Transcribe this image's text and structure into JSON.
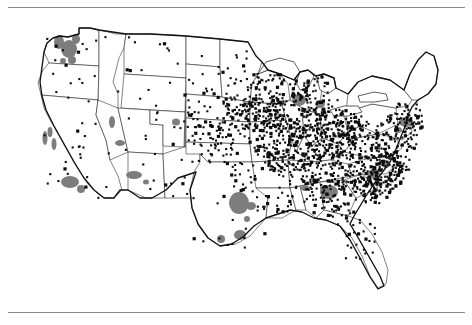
{
  "figure": {
    "kind": "dot-density-map",
    "region": "Contiguous United States",
    "rules": {
      "top": true,
      "bottom": true,
      "color": "#8a8a8a"
    }
  },
  "colors": {
    "background": "#ffffff",
    "dot": "#0d0d0d",
    "state_border": "#1a1a1a",
    "national_border": "#111111",
    "urban_shading": "#7d7d7d",
    "highlight_region": "#8e8e8e",
    "rule": "#8a8a8a"
  },
  "chart_data": {
    "type": "scatter",
    "title": "",
    "subtitle": "",
    "xlabel": "",
    "ylabel": "",
    "projection": "albers-usa-approx",
    "grid": false,
    "legend": "none",
    "xlim": [
      0,
      472
    ],
    "ylim": [
      0,
      296
    ],
    "series": [
      {
        "name": "observation-points",
        "marker": "square",
        "marker_size": 2.1,
        "color": "#0d0d0d",
        "count_visible": 1680,
        "description": "Black point markers densest in the Midwest, Ohio Valley, Mid-Atlantic and Southeast; sparse across the Great Basin, Rockies and desert Southwest."
      }
    ],
    "shaded_areas": [
      {
        "name": "highlight-nebraska-kansas",
        "color": "#8e8e8e",
        "description": "Rectangular gray block spanning Nebraska and northern Kansas"
      },
      {
        "name": "urban-puget-sound",
        "color": "#7d7d7d"
      },
      {
        "name": "urban-portland",
        "color": "#7d7d7d"
      },
      {
        "name": "urban-sf-bay",
        "color": "#7d7d7d"
      },
      {
        "name": "urban-los-angeles",
        "color": "#7d7d7d"
      },
      {
        "name": "urban-san-diego",
        "color": "#7d7d7d"
      },
      {
        "name": "urban-las-vegas",
        "color": "#7d7d7d"
      },
      {
        "name": "urban-phoenix",
        "color": "#7d7d7d"
      },
      {
        "name": "urban-tucson",
        "color": "#7d7d7d"
      },
      {
        "name": "urban-salt-lake-city",
        "color": "#7d7d7d"
      },
      {
        "name": "urban-denver",
        "color": "#7d7d7d"
      },
      {
        "name": "urban-dallas-fort-worth",
        "color": "#7d7d7d"
      },
      {
        "name": "urban-houston",
        "color": "#7d7d7d"
      },
      {
        "name": "urban-atlanta",
        "color": "#7d7d7d"
      },
      {
        "name": "urban-birmingham",
        "color": "#7d7d7d"
      },
      {
        "name": "urban-chicago",
        "color": "#7d7d7d"
      },
      {
        "name": "urban-detroit",
        "color": "#7d7d7d"
      },
      {
        "name": "urban-new-york",
        "color": "#7d7d7d"
      },
      {
        "name": "urban-charlotte",
        "color": "#7d7d7d"
      }
    ],
    "annotations": []
  },
  "map": {
    "nation_outline": "M 19 141 L 22 133 L 20 126 L 24 118 L 26 108 L 25 100 L 29 92 L 33 84 L 37 72 L 40 62 L 44 52 L 47 42 L 49 34 L 53 28 L 59 26 L 66 27 L 72 25 L 79 25 L 79 19 L 88 18 L 97 20 L 104 23 L 112 24 L 120 25 L 131 24 L 142 24 L 156 24 L 170 24 L 186 25 L 204 26 L 224 28 L 246 30 L 268 33 L 286 36 L 300 39 L 310 42 L 316 46 L 321 44 L 325 47 L 323 53 L 328 56 L 334 54 L 339 57 L 344 55 L 348 58 L 352 56 L 355 61 L 349 65 L 345 63 L 343 68 L 347 72 L 352 70 L 358 73 L 362 71 L 366 75 L 372 74 L 378 76 L 383 73 L 389 70 L 394 65 L 398 58 L 402 50 L 407 42 L 412 33 L 418 26 L 424 21 L 430 20 L 436 24 L 440 32 L 443 41 L 447 50 L 450 58 L 452 66 L 454 73 L 451 79 L 447 84 L 443 89 L 440 95 L 436 99 L 430 102 L 424 104 L 420 108 L 416 112 L 412 116 L 408 119 L 405 124 L 402 130 L 399 137 L 396 145 L 393 153 L 390 161 L 387 169 L 383 176 L 379 183 L 375 189 L 371 195 L 366 201 L 361 207 L 356 213 L 351 219 L 346 225 L 342 232 L 339 240 L 336 248 L 333 256 L 330 264 L 327 271 L 323 276 L 318 278 L 314 274 L 312 267 L 311 259 L 310 250 L 308 242 L 305 236 L 301 232 L 296 231 L 290 233 L 284 236 L 277 239 L 270 241 L 262 243 L 254 244 L 246 244 L 238 243 L 231 241 L 224 240 L 218 241 L 212 243 L 206 246 L 200 250 L 194 254 L 188 257 L 182 258 L 176 256 L 171 252 L 167 247 L 163 241 L 159 235 L 155 230 L 151 226 L 147 223 L 143 222 L 139 224 L 136 228 L 133 233 L 130 238 L 127 243 L 124 247 L 120 250 L 116 251 L 112 249 L 109 245 L 107 240 L 105 234 L 103 228 L 101 222 L 99 216 L 97 210 L 95 205 L 92 201 L 88 198 L 84 196 L 80 195 L 76 193 L 72 190 L 68 186 L 64 181 L 60 176 L 56 171 L 52 166 L 48 162 L 44 158 L 40 154 L 36 151 L 32 148 L 27 145 Z",
    "notes": "Single-color line map, no labels, no legend, no scale bar."
  }
}
